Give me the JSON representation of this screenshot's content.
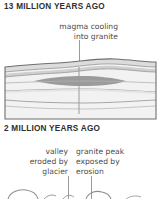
{
  "figure": {
    "name": "geologic-cross-section-diagram",
    "background": "#ffffff",
    "panels": [
      {
        "id": "panel-13ma",
        "title": "13 MILLION YEARS AGO",
        "annotation": "magma cooling\ninto granite",
        "annotation_lines": [
          "magma cooling",
          "into granite"
        ],
        "leader_line": {
          "x": 79,
          "y_top": 40,
          "y_bottom": 92,
          "color": "#9a9a9a"
        },
        "block": {
          "x": 5,
          "y": 62,
          "width": 151,
          "height": 58,
          "outline_color": "#6e6e6e",
          "fill_color": "#f2f2f2",
          "strata_line_color": "#9e9e9e",
          "strata_band_color": "#dcdcdc",
          "magma_lens": {
            "label": "magma cooling into granite",
            "fill_color": "#9b9b9b",
            "center_x": 79,
            "center_y": 81,
            "rx": 45,
            "ry": 4
          }
        }
      },
      {
        "id": "panel-2ma",
        "title": "2 MILLION YEARS AGO",
        "annotations": [
          {
            "id": "valley-annotation",
            "text": "valley\neroded by\nglacier",
            "lines": [
              "valley",
              "eroded by",
              "glacier"
            ],
            "align": "right",
            "leader_line": {
              "x": 68,
              "y_top": 176,
              "y_bottom": 199,
              "color": "#9a9a9a"
            }
          },
          {
            "id": "peak-annotation",
            "text": "granite peak\nexposed by\nerosion",
            "lines": [
              "granite peak",
              "exposed by",
              "erosion"
            ],
            "align": "left",
            "leader_line": {
              "x": 91,
              "y_top": 176,
              "y_bottom": 199,
              "color": "#9a9a9a"
            }
          }
        ],
        "cropped_note": "lower block diagram is cut off at the bottom edge of the image"
      }
    ],
    "colors": {
      "text": "#3a3a3a",
      "title_text": "#2e2e2e",
      "outline": "#6e6e6e",
      "leader": "#9a9a9a",
      "rock_light": "#f2f2f2",
      "rock_mid": "#e2e2e2",
      "rock_dark": "#cfcfcf",
      "magma": "#9b9b9b"
    }
  }
}
